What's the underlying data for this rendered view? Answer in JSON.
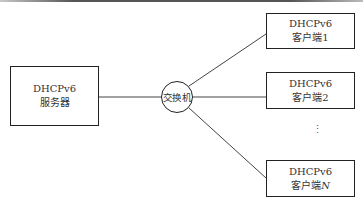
{
  "diagram": {
    "type": "network-topology",
    "server": {
      "line1": "DHCPv6",
      "line2": "服务器"
    },
    "switch": {
      "label": "交换机"
    },
    "clients": [
      {
        "line1": "DHCPv6",
        "line2": "客户端1"
      },
      {
        "line1": "DHCPv6",
        "line2": "客户端2"
      },
      {
        "line1": "DHCPv6",
        "line2_prefix": "客户端",
        "line2_var": "N"
      }
    ],
    "ellipsis": "⋮",
    "colors": {
      "stroke": "#222222",
      "text": "#333333",
      "background": "#ffffff"
    }
  }
}
